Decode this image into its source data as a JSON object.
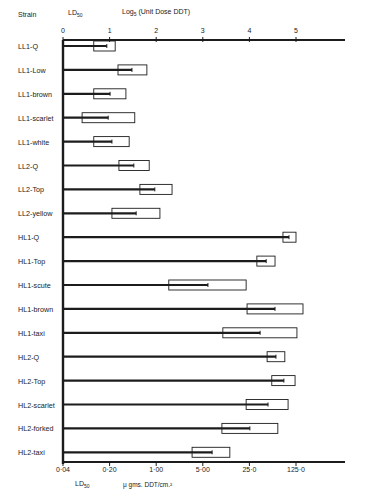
{
  "chart_data": {
    "type": "bar",
    "subtype": "horizontal range bars (LD50 with confidence box)",
    "title": "",
    "header_left": "Strain",
    "top_axis": {
      "label_ld": "LD50",
      "label": "Log5 (Unit Dose DDT)",
      "ticks": [
        "0",
        "1",
        "2",
        "3",
        "4",
        "5"
      ],
      "range": [
        0,
        6
      ]
    },
    "bottom_axis": {
      "label_ld": "LD50",
      "label": "μ gms. DDT/cm.²",
      "ticks": [
        "0·04",
        "0·20",
        "1·00",
        "5·00",
        "25·0",
        "125·0"
      ]
    },
    "categories": [
      "LL1-Q",
      "LL1-Low",
      "LL1-brown",
      "LL1-scarlet",
      "LL1-white",
      "LL2-Q",
      "LL2-Top",
      "LL2-yellow",
      "HL1-Q",
      "HL1-Top",
      "HL1-scute",
      "HL1-brown",
      "HL1-taxi",
      "HL2-Q",
      "HL2-Top",
      "HL2-scarlet",
      "HL2-forked",
      "HL2-taxi"
    ],
    "series": [
      {
        "name": "LD50 (log5 unit dose)",
        "values": [
          0.94,
          1.48,
          1.01,
          0.97,
          1.05,
          1.52,
          1.97,
          1.57,
          4.85,
          4.36,
          3.11,
          4.55,
          4.23,
          4.57,
          4.74,
          4.4,
          4.01,
          3.2
        ]
      },
      {
        "name": "Interval lower (log5)",
        "values": [
          0.66,
          1.18,
          0.66,
          0.41,
          0.66,
          1.2,
          1.65,
          1.05,
          4.72,
          4.16,
          2.27,
          3.95,
          3.43,
          4.38,
          4.48,
          3.93,
          3.41,
          2.77
        ]
      },
      {
        "name": "Interval upper (log5)",
        "values": [
          1.12,
          1.8,
          1.35,
          1.54,
          1.42,
          1.85,
          2.34,
          2.08,
          5.0,
          4.55,
          3.93,
          5.15,
          5.02,
          4.76,
          4.98,
          4.83,
          4.61,
          3.58
        ]
      }
    ],
    "xlabel": "Log5 (Unit Dose DDT) / μ gms. DDT/cm.²",
    "ylabel": "Strain",
    "xlim": [
      0,
      6
    ],
    "grid": false,
    "legend": "none"
  },
  "labels": {
    "strain": "Strain",
    "ld_top": "LD",
    "ld_sub": "50",
    "top_axis_title_pre": "Log",
    "top_axis_title_sub": "5",
    "top_axis_title_post": " (Unit Dose DDT)",
    "ld_bottom": "LD",
    "ld_bottom_sub": "50",
    "bottom_axis_title": "μ gms. DDT/cm.²"
  }
}
